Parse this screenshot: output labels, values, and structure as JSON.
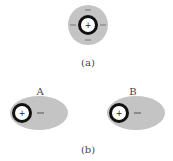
{
  "figure": {
    "panel_a": {
      "caption": "(a)",
      "center_charge": "+",
      "surrounding_charges": [
        "−",
        "−",
        "−",
        "−"
      ]
    },
    "panel_b": {
      "caption": "(b)",
      "molecules": [
        {
          "label": "A",
          "center_charge": "+",
          "side_charge": "−"
        },
        {
          "label": "B",
          "center_charge": "+",
          "side_charge": "−"
        }
      ]
    },
    "colors": {
      "cloud": "#c4c4c4",
      "ring": "#111111",
      "core": "#ffffff"
    }
  }
}
